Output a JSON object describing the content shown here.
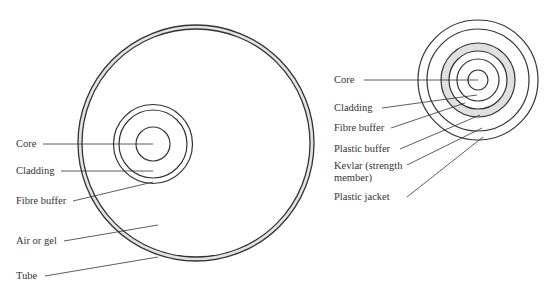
{
  "left_diagram": {
    "title": "Loose tube cable cross-section",
    "labels": [
      {
        "id": "core",
        "text": "Core",
        "x": 16,
        "y": 139
      },
      {
        "id": "cladding",
        "text": "Cladding",
        "x": 16,
        "y": 165
      },
      {
        "id": "fibre-buffer",
        "text": "Fibre buffer",
        "x": 16,
        "y": 195
      },
      {
        "id": "air-or-gel",
        "text": "Air or gel",
        "x": 16,
        "y": 235
      },
      {
        "id": "tube",
        "text": "Tube",
        "x": 16,
        "y": 270
      }
    ]
  },
  "right_diagram": {
    "title": "Tight buffer cable cross-section",
    "labels": [
      {
        "id": "core",
        "text": "Core",
        "x": 334,
        "y": 74
      },
      {
        "id": "cladding",
        "text": "Cladding",
        "x": 334,
        "y": 102
      },
      {
        "id": "fibre-buffer",
        "text": "Fibre buffer",
        "x": 334,
        "y": 122
      },
      {
        "id": "plastic-buffer",
        "text": "Plastic buffer",
        "x": 334,
        "y": 143
      },
      {
        "id": "kevlar",
        "text": "Kevlar (strength",
        "x": 334,
        "y": 160
      },
      {
        "id": "kevlar-2",
        "text": "member)",
        "x": 334,
        "y": 172
      },
      {
        "id": "plastic-jacket",
        "text": "Plastic jacket",
        "x": 334,
        "y": 191
      }
    ]
  },
  "colors": {
    "stroke": "#333333",
    "fill_shaded": "#e0e0e0",
    "background": "#ffffff"
  }
}
